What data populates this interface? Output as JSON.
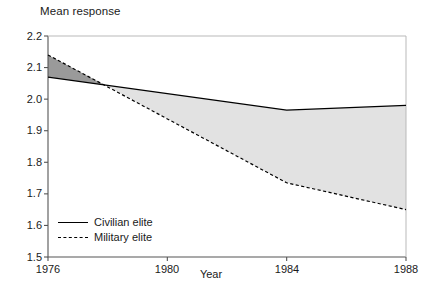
{
  "chart_data": {
    "type": "area",
    "title": "Mean response",
    "xlabel": "Year",
    "ylabel": "Mean response",
    "x": [
      1976,
      1984,
      1988
    ],
    "xlim": [
      1976,
      1988
    ],
    "ylim": [
      1.5,
      2.2
    ],
    "xticks": [
      "1976",
      "1980",
      "1984",
      "1988"
    ],
    "xtick_values": [
      1976,
      1980,
      1984,
      1988
    ],
    "yticks": [
      "1.5",
      "1.6",
      "1.7",
      "1.8",
      "1.9",
      "2.0",
      "2.1",
      "2.2"
    ],
    "ytick_values": [
      1.5,
      1.6,
      1.7,
      1.8,
      1.9,
      2.0,
      2.1,
      2.2
    ],
    "grid": false,
    "legend_position": "lower-left",
    "series": [
      {
        "name": "Civilian elite",
        "style": "solid",
        "values": [
          2.07,
          1.965,
          1.98
        ]
      },
      {
        "name": "Military elite",
        "style": "dashed",
        "values": [
          2.14,
          1.735,
          1.65
        ]
      }
    ],
    "crossover_year": 1977.9,
    "crossover_value": 2.045,
    "fill_above_color": "#9a9a9a",
    "fill_below_color": "#e2e2e2",
    "line_color": "#000000",
    "axis_color": "#555555"
  },
  "axis": {
    "y_ticks": [
      "2.2",
      "2.1",
      "2.0",
      "1.9",
      "1.8",
      "1.7",
      "1.6",
      "1.5"
    ],
    "x_ticks": [
      "1976",
      "1980",
      "1984",
      "1988"
    ],
    "x_axis_name": "Year"
  },
  "title": {
    "text": "Mean response"
  },
  "legend": {
    "items": [
      {
        "label": "Civilian elite"
      },
      {
        "label": "Military elite"
      }
    ]
  }
}
